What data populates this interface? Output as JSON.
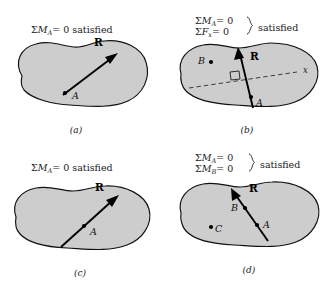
{
  "figure": {
    "colors": {
      "body_fill": "#cdcdcd",
      "body_outline": "#111111",
      "vector": "#000000",
      "background": "#ffffff"
    },
    "panels": [
      {
        "id": "a",
        "caption": "(a)",
        "conditions": [
          {
            "sigma": "Σ",
            "quantity": "M",
            "subscript": "A",
            "equals": "= 0"
          }
        ],
        "status": "satisfied",
        "vector_label": "R",
        "points": [
          {
            "label": "A",
            "on_line": true
          }
        ],
        "has_axis": false,
        "axis_label": "",
        "has_right_angle": false,
        "brace": false
      },
      {
        "id": "b",
        "caption": "(b)",
        "conditions": [
          {
            "sigma": "Σ",
            "quantity": "M",
            "subscript": "A",
            "equals": "= 0"
          },
          {
            "sigma": "Σ",
            "quantity": "F",
            "subscript": "x",
            "equals": "= 0"
          }
        ],
        "status": "satisfied",
        "vector_label": "R",
        "points": [
          {
            "label": "A",
            "on_line": true
          },
          {
            "label": "B",
            "on_line": false
          }
        ],
        "has_axis": true,
        "axis_label": "x",
        "has_right_angle": true,
        "brace": true
      },
      {
        "id": "c",
        "caption": "(c)",
        "conditions": [
          {
            "sigma": "Σ",
            "quantity": "M",
            "subscript": "A",
            "equals": "= 0"
          }
        ],
        "status": "satisfied",
        "vector_label": "R",
        "points": [
          {
            "label": "A",
            "on_line": true
          }
        ],
        "has_axis": false,
        "axis_label": "",
        "has_right_angle": false,
        "brace": false
      },
      {
        "id": "d",
        "caption": "(d)",
        "conditions": [
          {
            "sigma": "Σ",
            "quantity": "M",
            "subscript": "A",
            "equals": "= 0"
          },
          {
            "sigma": "Σ",
            "quantity": "M",
            "subscript": "B",
            "equals": "= 0"
          }
        ],
        "status": "satisfied",
        "vector_label": "R",
        "points": [
          {
            "label": "A",
            "on_line": true
          },
          {
            "label": "B",
            "on_line": true
          },
          {
            "label": "C",
            "on_line": false
          }
        ],
        "has_axis": false,
        "axis_label": "",
        "has_right_angle": false,
        "brace": true
      }
    ]
  }
}
